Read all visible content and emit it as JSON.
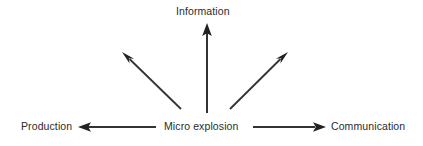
{
  "diagram": {
    "type": "radial-flow-diagram",
    "background_color": "#ffffff",
    "stroke_color": "#333333",
    "text_color": "#2b2b2b",
    "center_node": {
      "id": "micro-explosion",
      "label": "Micro explosion"
    },
    "nodes": [
      {
        "id": "information",
        "label": "Information"
      },
      {
        "id": "production",
        "label": "Production"
      },
      {
        "id": "micro-explosion",
        "label": "Micro explosion"
      },
      {
        "id": "communication",
        "label": "Communication"
      }
    ],
    "arrows": [
      {
        "id": "arrow-up-information",
        "from": "micro-explosion",
        "to": "information",
        "direction": "up",
        "labelled": true
      },
      {
        "id": "arrow-left-production",
        "from": "micro-explosion",
        "to": "production",
        "direction": "left",
        "labelled": true
      },
      {
        "id": "arrow-right-communication",
        "from": "micro-explosion",
        "to": "communication",
        "direction": "right",
        "labelled": true
      },
      {
        "id": "arrow-diagonal-upper-left",
        "from": "micro-explosion",
        "to": "",
        "direction": "upper-left",
        "labelled": false
      },
      {
        "id": "arrow-diagonal-upper-right",
        "from": "micro-explosion",
        "to": "",
        "direction": "upper-right",
        "labelled": false
      }
    ]
  }
}
